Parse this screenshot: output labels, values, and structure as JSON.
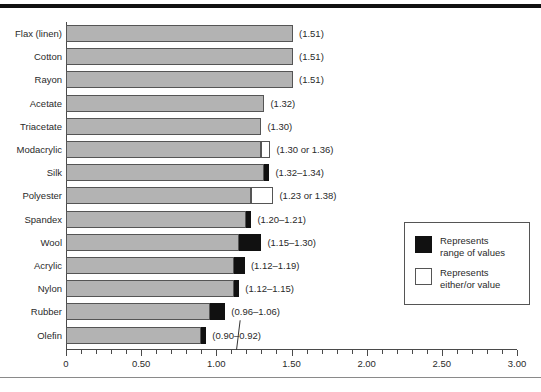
{
  "chart_data": {
    "type": "bar",
    "orientation": "horizontal",
    "title": "",
    "xlabel": "",
    "ylabel": "",
    "xlim": [
      0,
      3.0
    ],
    "grid": false,
    "tick_labels": [
      "0",
      "0.50",
      "1.00",
      "1.50",
      "2.00",
      "2.50",
      "3.00"
    ],
    "tick_values": [
      0,
      0.5,
      1.0,
      1.5,
      2.0,
      2.5,
      3.0
    ],
    "minor_tick_step": 0.1,
    "categories": [
      "Flax (linen)",
      "Cotton",
      "Rayon",
      "Acetate",
      "Triacetate",
      "Modacrylic",
      "Silk",
      "Polyester",
      "Spandex",
      "Wool",
      "Acrylic",
      "Nylon",
      "Rubber",
      "Olefin"
    ],
    "values": [
      1.51,
      1.51,
      1.51,
      1.32,
      1.3,
      1.36,
      1.34,
      1.38,
      1.21,
      1.3,
      1.19,
      1.15,
      1.06,
      0.92
    ],
    "bars": [
      {
        "category": "Flax (linen)",
        "label": "(1.51)",
        "base": 1.51,
        "marker": "none",
        "marker_start": 1.51,
        "marker_end": 1.51
      },
      {
        "category": "Cotton",
        "label": "(1.51)",
        "base": 1.51,
        "marker": "none",
        "marker_start": 1.51,
        "marker_end": 1.51
      },
      {
        "category": "Rayon",
        "label": "(1.51)",
        "base": 1.51,
        "marker": "none",
        "marker_start": 1.51,
        "marker_end": 1.51
      },
      {
        "category": "Acetate",
        "label": "(1.32)",
        "base": 1.32,
        "marker": "none",
        "marker_start": 1.32,
        "marker_end": 1.32
      },
      {
        "category": "Triacetate",
        "label": "(1.30)",
        "base": 1.3,
        "marker": "none",
        "marker_start": 1.3,
        "marker_end": 1.3
      },
      {
        "category": "Modacrylic",
        "label": "(1.30 or 1.36)",
        "base": 1.3,
        "marker": "either",
        "marker_start": 1.3,
        "marker_end": 1.36
      },
      {
        "category": "Silk",
        "label": "(1.32–1.34)",
        "base": 1.32,
        "marker": "range",
        "marker_start": 1.32,
        "marker_end": 1.34
      },
      {
        "category": "Polyester",
        "label": "(1.23 or 1.38)",
        "base": 1.23,
        "marker": "either",
        "marker_start": 1.23,
        "marker_end": 1.38
      },
      {
        "category": "Spandex",
        "label": "(1.20–1.21)",
        "base": 1.2,
        "marker": "range",
        "marker_start": 1.2,
        "marker_end": 1.21
      },
      {
        "category": "Wool",
        "label": "(1.15–1.30)",
        "base": 1.15,
        "marker": "range",
        "marker_start": 1.15,
        "marker_end": 1.3
      },
      {
        "category": "Acrylic",
        "label": "(1.12–1.19)",
        "base": 1.12,
        "marker": "range",
        "marker_start": 1.12,
        "marker_end": 1.19
      },
      {
        "category": "Nylon",
        "label": "(1.12–1.15)",
        "base": 1.12,
        "marker": "range",
        "marker_start": 1.12,
        "marker_end": 1.15
      },
      {
        "category": "Rubber",
        "label": "(0.96–1.06)",
        "base": 0.96,
        "marker": "range",
        "marker_start": 0.96,
        "marker_end": 1.06
      },
      {
        "category": "Olefin",
        "label": "(0.90–0.92)",
        "base": 0.9,
        "marker": "range",
        "marker_start": 0.9,
        "marker_end": 0.92
      }
    ],
    "legend": {
      "position": "right",
      "entries": [
        {
          "swatch": "black",
          "line1": "Represents",
          "line2": "range of values"
        },
        {
          "swatch": "white",
          "line1": "Represents",
          "line2": "either/or value"
        }
      ]
    },
    "colors": {
      "bar_fill": "#b3b3b3",
      "bar_stroke": "#555555",
      "range_marker": "#111111",
      "either_marker": "#ffffff",
      "axis": "#4a4a4a",
      "text": "#2a2a2a",
      "top_rule": "#111111",
      "bottom_rule": "#8a8a8a"
    }
  }
}
